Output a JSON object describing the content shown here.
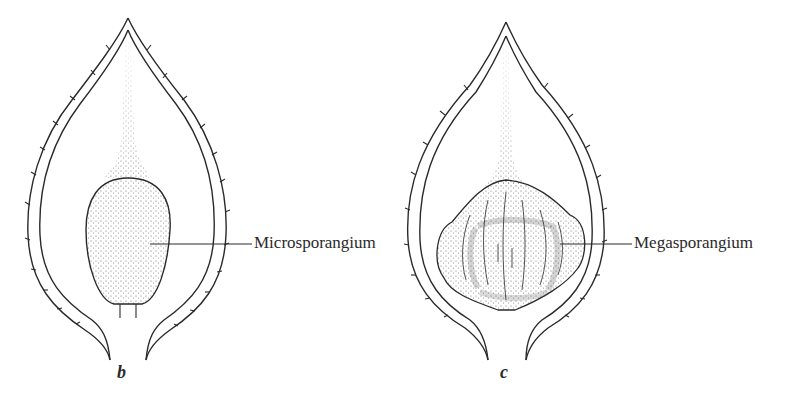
{
  "figures": [
    {
      "id": "b",
      "letter": "b",
      "label": "Microsporangium",
      "structure": "microsporangium"
    },
    {
      "id": "c",
      "letter": "c",
      "label": "Megasporangium",
      "structure": "megasporangium"
    }
  ],
  "colors": {
    "line": "#2a2a2a",
    "stipple": "#555555",
    "background": "#ffffff"
  }
}
